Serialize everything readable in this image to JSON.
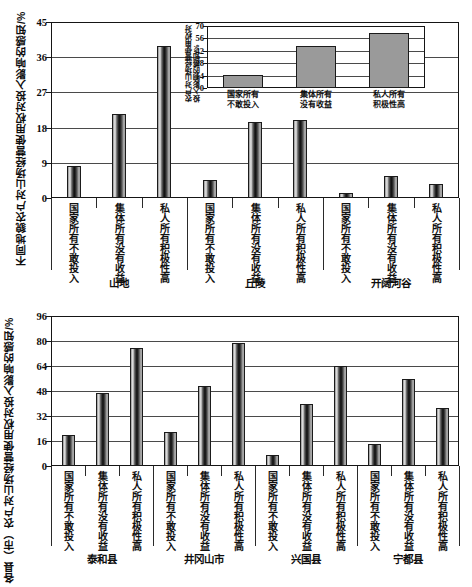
{
  "chart_data": [
    {
      "id": "top",
      "type": "bar",
      "title": "",
      "ylabel": "不同地貌农户对山场经营使用权对投入影响的感知/%",
      "xlabel": "",
      "ylim": [
        0,
        45
      ],
      "yticks": [
        0,
        9,
        18,
        27,
        36,
        45
      ],
      "grid": true,
      "legend": "none",
      "groups": [
        {
          "label": "山地",
          "categories": [
            "国家所有不敢投入",
            "集体所有没有收益",
            "私人所有积极性高"
          ],
          "values": [
            8.3,
            21.5,
            38.8
          ]
        },
        {
          "label": "丘陵",
          "categories": [
            "国家所有不敢投入",
            "集体所有没有收益",
            "私人所有积极性高"
          ],
          "values": [
            4.5,
            19.5,
            20.0
          ]
        },
        {
          "label": "开阔河谷",
          "categories": [
            "国家所有不敢投入",
            "集体所有没有收益",
            "私人所有积极性高"
          ],
          "values": [
            1.2,
            5.5,
            3.5
          ]
        }
      ]
    },
    {
      "id": "inset",
      "type": "bar",
      "title": "",
      "ylabel": "农户对山场经营使用权对投入影响的感知/%",
      "xlabel": "",
      "ylim": [
        0,
        70
      ],
      "yticks": [
        0,
        14,
        28,
        42,
        56,
        70
      ],
      "grid": true,
      "legend": "none",
      "categories": [
        "国家所有\n不敢投入",
        "集体所有\n没有收益",
        "私人所有\n积极性高"
      ],
      "values": [
        14.5,
        47.0,
        62.0
      ]
    },
    {
      "id": "bottom",
      "type": "bar",
      "title": "",
      "ylabel": "各县（市）农户对山场经营使用权对投入影响的感知/%",
      "xlabel": "",
      "ylim": [
        0,
        96
      ],
      "yticks": [
        0,
        16,
        32,
        48,
        64,
        80,
        96
      ],
      "grid": true,
      "legend": "none",
      "groups": [
        {
          "label": "泰和县",
          "categories": [
            "国家所有不敢投入",
            "集体所有没有收益",
            "私人所有积极性高"
          ],
          "values": [
            20.0,
            46.5,
            75.5
          ]
        },
        {
          "label": "井冈山市",
          "categories": [
            "国家所有不敢投入",
            "集体所有没有收益",
            "私人所有积极性高"
          ],
          "values": [
            22.0,
            51.5,
            78.5
          ]
        },
        {
          "label": "兴国县",
          "categories": [
            "国家所有不敢投入",
            "集体所有没有收益",
            "私人所有积极性高"
          ],
          "values": [
            7.0,
            40.0,
            64.0
          ]
        },
        {
          "label": "宁都县",
          "categories": [
            "国家所有不敢投入",
            "集体所有没有收益",
            "私人所有积极性高"
          ],
          "values": [
            14.0,
            56.0,
            37.0
          ]
        }
      ]
    }
  ]
}
